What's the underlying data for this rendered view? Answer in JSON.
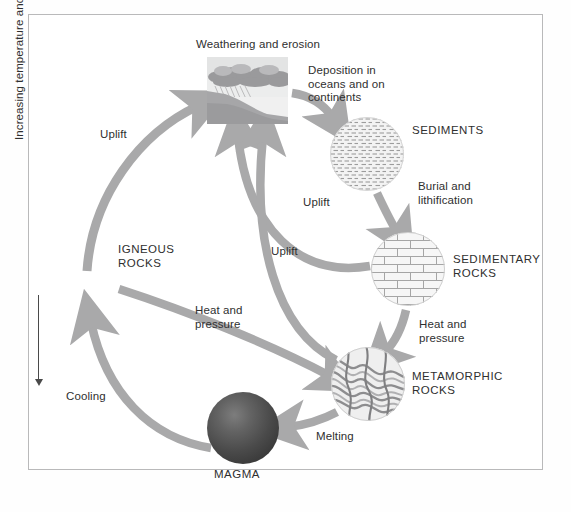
{
  "diagram": {
    "frame_color": "#b9b9ba",
    "arrow_color": "#a9a9aa",
    "text_color": "#2f2f2f"
  },
  "axis": {
    "label": "Increasing temperature and pressure",
    "direction": "downward-arrow"
  },
  "nodes": [
    {
      "id": "weathering",
      "label": "Weathering and erosion",
      "icon": "landscape-rain-scene",
      "shape": "rect",
      "x": 206,
      "y": 56,
      "w": 83,
      "h": 69
    },
    {
      "id": "sediments",
      "label": "SEDIMENTS",
      "icon": "dashed-layers-circle",
      "shape": "circle",
      "x": 330,
      "y": 117,
      "w": 74,
      "h": 74
    },
    {
      "id": "sedimentary",
      "label": "SEDIMENTARY\nROCKS",
      "icon": "brick-pattern-circle",
      "shape": "circle",
      "x": 371,
      "y": 232,
      "w": 74,
      "h": 74
    },
    {
      "id": "metamorphic",
      "label": "METAMORPHIC\nROCKS",
      "icon": "folded-bands-circle",
      "shape": "circle",
      "x": 331,
      "y": 347,
      "w": 74,
      "h": 74
    },
    {
      "id": "magma",
      "label": "MAGMA",
      "icon": "dark-sphere",
      "shape": "circle",
      "x": 207,
      "y": 392,
      "w": 72,
      "h": 72
    },
    {
      "id": "igneous",
      "label": "IGNEOUS\nROCKS",
      "icon": "none",
      "shape": "text",
      "x": 118,
      "y": 243,
      "w": 70,
      "h": 30
    }
  ],
  "arrows": [
    {
      "id": "uplift-igneous-to-weathering",
      "label": "Uplift",
      "from": "igneous",
      "to": "weathering"
    },
    {
      "id": "deposition",
      "label": "Deposition in\noceans and on\ncontinents",
      "from": "weathering",
      "to": "sediments"
    },
    {
      "id": "burial",
      "label": "Burial and\nlithification",
      "from": "sediments",
      "to": "sedimentary"
    },
    {
      "id": "heat-pressure-sedimentary",
      "label": "Heat and\npressure",
      "from": "sedimentary",
      "to": "metamorphic"
    },
    {
      "id": "uplift-sedimentary-to-weathering",
      "label": "Uplift",
      "from": "sedimentary",
      "to": "weathering"
    },
    {
      "id": "uplift-metamorphic-to-weathering",
      "label": "Uplift",
      "from": "metamorphic",
      "to": "weathering"
    },
    {
      "id": "melting",
      "label": "Melting",
      "from": "metamorphic",
      "to": "magma"
    },
    {
      "id": "cooling",
      "label": "Cooling",
      "from": "magma",
      "to": "igneous"
    },
    {
      "id": "heat-pressure-igneous",
      "label": "Heat and\npressure",
      "from": "igneous",
      "to": "metamorphic"
    }
  ],
  "labels": {
    "weathering_title": "Weathering and erosion",
    "deposition": "Deposition in\noceans and on\ncontinents",
    "sediments": "SEDIMENTS",
    "burial": "Burial and\nlithification",
    "sedimentary": "SEDIMENTARY\nROCKS",
    "heat_pressure_right": "Heat and\npressure",
    "metamorphic": "METAMORPHIC\nROCKS",
    "melting": "Melting",
    "magma": "MAGMA",
    "cooling": "Cooling",
    "igneous": "IGNEOUS\nROCKS",
    "uplift_left": "Uplift",
    "uplift_mid": "Uplift",
    "uplift_upper": "Uplift",
    "heat_pressure_center": "Heat and\npressure",
    "axis": "Increasing temperature and pressure"
  }
}
